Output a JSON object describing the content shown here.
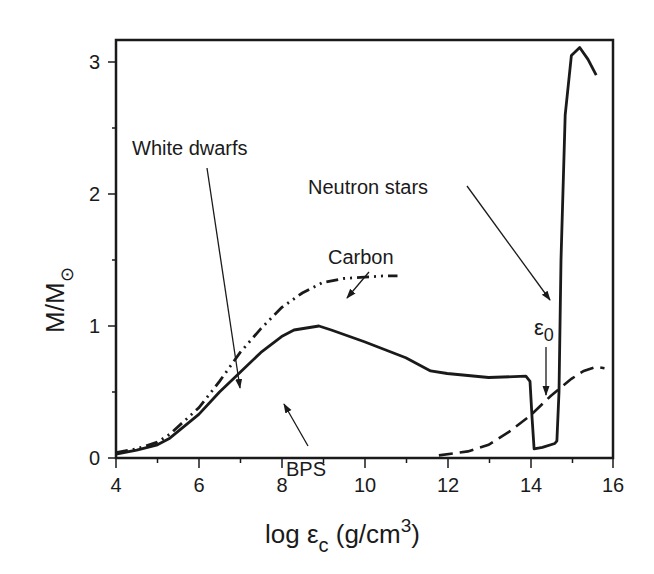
{
  "chart_data": {
    "type": "line",
    "title": "",
    "xlabel": "log ε_c (g/cm^3)",
    "ylabel": "M/M_⊙",
    "xlim": [
      4,
      16
    ],
    "ylim": [
      0,
      3.2
    ],
    "xticks": [
      4,
      6,
      8,
      10,
      12,
      14,
      16
    ],
    "yticks": [
      0,
      1,
      2,
      3
    ],
    "grid": false,
    "legend": "none",
    "series": [
      {
        "name": "BPS",
        "style": "solid",
        "x": [
          4.0,
          4.5,
          5.0,
          5.3,
          6.0,
          6.5,
          7.0,
          7.5,
          8.0,
          8.3,
          8.9,
          9.2,
          10.0,
          11.0,
          11.6,
          12.0,
          13.0,
          13.9,
          14.0,
          14.05,
          14.1,
          14.3,
          14.6,
          14.65,
          14.7,
          14.75,
          14.85,
          15.0,
          15.2,
          15.4,
          15.6
        ],
        "y": [
          0.03,
          0.06,
          0.1,
          0.15,
          0.33,
          0.5,
          0.65,
          0.8,
          0.92,
          0.97,
          1.0,
          0.97,
          0.88,
          0.76,
          0.66,
          0.64,
          0.61,
          0.62,
          0.58,
          0.3,
          0.07,
          0.08,
          0.11,
          0.13,
          0.5,
          1.5,
          2.6,
          3.05,
          3.11,
          3.02,
          2.9
        ]
      },
      {
        "name": "Carbon",
        "style": "dash-dot-dot",
        "x": [
          4.0,
          4.5,
          5.0,
          5.3,
          6.0,
          6.5,
          7.0,
          7.5,
          8.0,
          8.5,
          9.0,
          9.5,
          10.0,
          10.5,
          10.8
        ],
        "y": [
          0.04,
          0.07,
          0.12,
          0.18,
          0.38,
          0.58,
          0.8,
          0.98,
          1.14,
          1.25,
          1.33,
          1.36,
          1.37,
          1.38,
          1.38
        ]
      },
      {
        "name": "Neutron stars (dashed)",
        "style": "dashed",
        "x": [
          11.8,
          12.5,
          13.0,
          13.5,
          14.0,
          14.5,
          15.0,
          15.3,
          15.6,
          15.8
        ],
        "y": [
          0.02,
          0.05,
          0.1,
          0.2,
          0.32,
          0.47,
          0.6,
          0.66,
          0.69,
          0.68
        ]
      }
    ],
    "annotations": [
      {
        "text": "White dwarfs",
        "arrow_to": [
          7.0,
          0.8
        ]
      },
      {
        "text": "Carbon",
        "arrow_to": [
          9.5,
          1.37
        ]
      },
      {
        "text": "BPS",
        "arrow_to": [
          8.0,
          0.91
        ]
      },
      {
        "text": "Neutron stars",
        "arrow_to": [
          14.5,
          1.47
        ]
      },
      {
        "text": "ε0",
        "arrow_to": [
          14.4,
          0.58
        ]
      }
    ]
  },
  "labels": {
    "white_dwarfs": "White dwarfs",
    "carbon": "Carbon",
    "bps": "BPS",
    "neutron_stars": "Neutron stars",
    "eps": "ε",
    "eps_sub": "0",
    "xlabel_main": "log ε",
    "xlabel_sub": "c",
    "xlabel_unit": " (g/cm",
    "xlabel_sup": "3",
    "xlabel_close": ")",
    "ylabel_main": "M/M",
    "ylabel_sub": "⊙"
  },
  "ticks": {
    "x": [
      "4",
      "6",
      "8",
      "10",
      "12",
      "14",
      "16"
    ],
    "y": [
      "0",
      "1",
      "2",
      "3"
    ]
  }
}
